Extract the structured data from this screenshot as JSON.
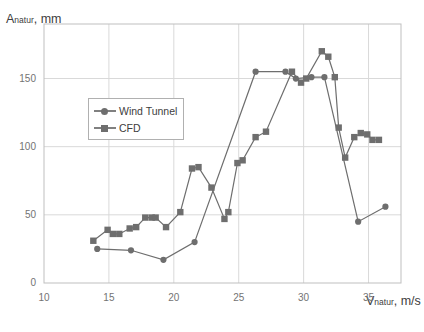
{
  "chart_data": {
    "type": "line",
    "title": "",
    "ylabel": "Anatur, mm",
    "xlabel": "Vnatur, m/s",
    "ylabel_main": "A",
    "ylabel_sub": "natur",
    "ylabel_unit": ", mm",
    "xlabel_main": "V",
    "xlabel_sub": "natur",
    "xlabel_unit": ", m/s",
    "xlim": [
      10,
      37.5
    ],
    "ylim": [
      0,
      190
    ],
    "xticks": [
      10,
      15,
      20,
      25,
      30,
      35
    ],
    "yticks": [
      0,
      50,
      100,
      150
    ],
    "grid": true,
    "legend_position": "inside-left",
    "series": [
      {
        "name": "Wind Tunnel",
        "marker": "circle",
        "color": "#6e6e6e",
        "points": [
          [
            14.1,
            25
          ],
          [
            16.7,
            24
          ],
          [
            19.2,
            17
          ],
          [
            21.6,
            30
          ],
          [
            26.3,
            155
          ],
          [
            28.6,
            155
          ],
          [
            29.4,
            150
          ],
          [
            30.6,
            151
          ],
          [
            31.6,
            151
          ],
          [
            34.2,
            45
          ],
          [
            36.3,
            56
          ]
        ]
      },
      {
        "name": "CFD",
        "marker": "square",
        "color": "#6e6e6e",
        "points": [
          [
            13.8,
            31
          ],
          [
            14.9,
            39
          ],
          [
            15.3,
            36
          ],
          [
            15.8,
            36
          ],
          [
            16.6,
            40
          ],
          [
            17.1,
            41
          ],
          [
            17.8,
            48
          ],
          [
            18.3,
            48
          ],
          [
            18.6,
            48
          ],
          [
            19.4,
            41
          ],
          [
            20.5,
            52
          ],
          [
            21.4,
            84
          ],
          [
            21.9,
            85
          ],
          [
            22.9,
            70
          ],
          [
            23.9,
            47
          ],
          [
            24.2,
            52
          ],
          [
            24.9,
            88
          ],
          [
            25.3,
            90
          ],
          [
            26.3,
            107
          ],
          [
            27.1,
            111
          ],
          [
            29.1,
            155
          ],
          [
            29.8,
            147
          ],
          [
            30.2,
            150
          ],
          [
            31.4,
            170
          ],
          [
            31.9,
            166
          ],
          [
            32.4,
            151
          ],
          [
            32.7,
            114
          ],
          [
            33.2,
            92
          ],
          [
            33.9,
            107
          ],
          [
            34.4,
            110
          ],
          [
            34.9,
            109
          ],
          [
            35.3,
            105
          ],
          [
            35.8,
            105
          ]
        ]
      }
    ]
  },
  "legend": {
    "items": [
      {
        "label": "Wind Tunnel"
      },
      {
        "label": "CFD"
      }
    ]
  }
}
